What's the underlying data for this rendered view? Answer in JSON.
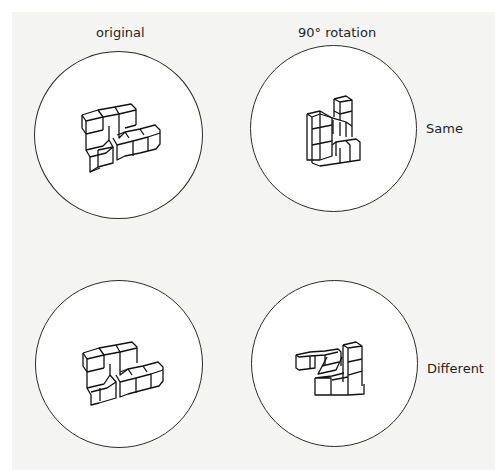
{
  "diagram": {
    "type": "mental-rotation-task",
    "column_headers": [
      "original",
      "90° rotation"
    ],
    "rows": [
      {
        "original_label": "",
        "comparison_label": "Same",
        "result": "Same"
      },
      {
        "original_label": "",
        "comparison_label": "Different",
        "result": "Different"
      }
    ],
    "stimuli": [
      {
        "id": "top-left",
        "description": "3D cube figure, original orientation"
      },
      {
        "id": "top-right",
        "description": "same cube figure rotated 90°"
      },
      {
        "id": "bottom-left",
        "description": "3D cube figure, original orientation"
      },
      {
        "id": "bottom-right",
        "description": "mirror-image cube figure, rotated"
      }
    ]
  },
  "labels": {
    "original": "original",
    "rotation": "90° rotation",
    "same": "Same",
    "different": "Different"
  }
}
